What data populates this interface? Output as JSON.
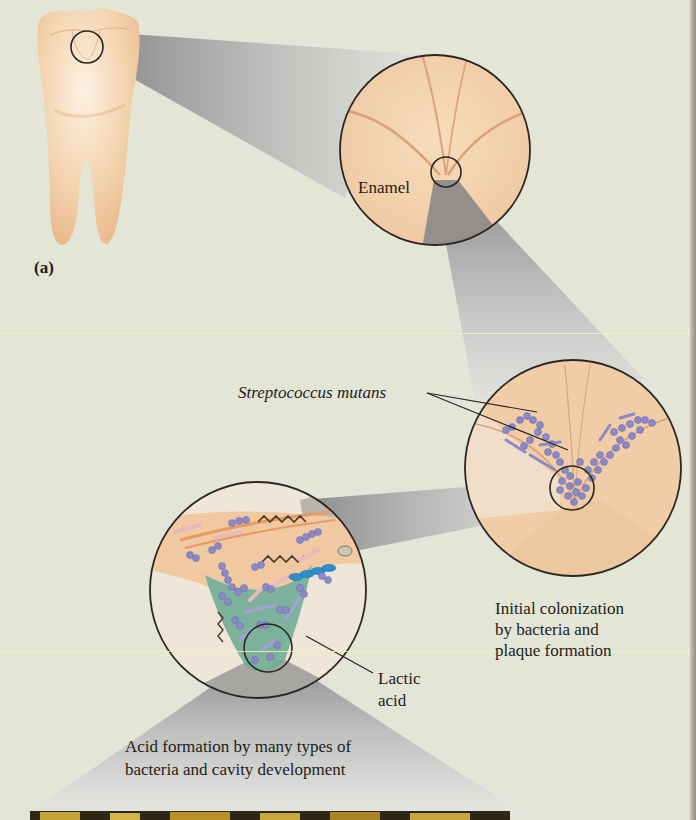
{
  "figure": {
    "panel_label": "(a)",
    "colors": {
      "background": "#e3e5d6",
      "enamel": "#f1cfa8",
      "enamel_line": "#d89a6a",
      "beam_dark": "#8e8d8c",
      "beam_light": "#d6d8d8",
      "bacteria": "#8c89c8",
      "acid": "#6fae9a",
      "chain_blue": "#2b8fd0",
      "outline": "#2a2522"
    },
    "stages": [
      {
        "id": "tooth",
        "description": "Molar tooth with magnified region on crown"
      },
      {
        "id": "enamel",
        "label": "Enamel"
      },
      {
        "id": "colonization",
        "pointer_label": "Streptococcus mutans",
        "caption": [
          "Initial colonization",
          "by bacteria and",
          "plaque formation"
        ]
      },
      {
        "id": "cavity",
        "pointer_label": [
          "Lactic",
          "acid"
        ],
        "caption": [
          "Acid formation by many types of",
          "bacteria and cavity development"
        ]
      }
    ]
  }
}
